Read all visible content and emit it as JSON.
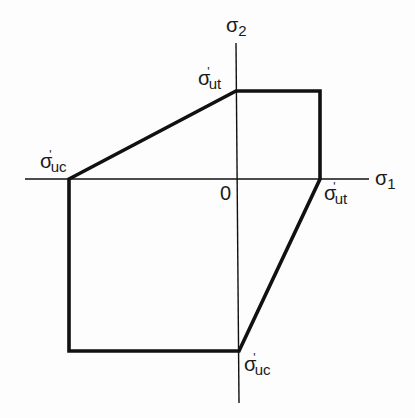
{
  "diagram": {
    "axes": {
      "x_label_symbol": "σ",
      "x_label_sub": "1",
      "y_label_symbol": "σ",
      "y_label_sub": "2",
      "origin_label": "0"
    },
    "labels": {
      "top_ut": {
        "symbol": "σ",
        "prime": "'",
        "sub": "ut"
      },
      "left_uc": {
        "symbol": "σ",
        "prime": "'",
        "sub": "uc"
      },
      "right_ut": {
        "symbol": "σ",
        "prime": "'",
        "sub": "ut"
      },
      "bottom_uc": {
        "symbol": "σ",
        "prime": "'",
        "sub": "uc"
      }
    },
    "colors": {
      "line": "#111111",
      "background": "#fdfdfd"
    }
  }
}
